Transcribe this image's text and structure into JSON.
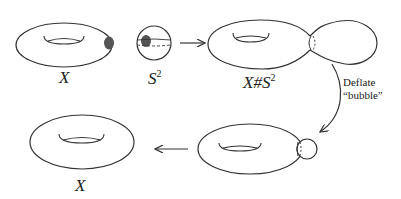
{
  "figure": {
    "stroke_color": "#333333",
    "blob_color": "#555555",
    "labels": {
      "torus_top": "X",
      "sphere_base": "S",
      "sphere_exp": "2",
      "sum_base": "X#S",
      "sum_exp": "2",
      "deflate_line1": "Deflate",
      "deflate_line2": "“bubble”",
      "torus_bottom": "X"
    },
    "nodes": [
      {
        "id": "torus-X",
        "label": "X"
      },
      {
        "id": "sphere-S2",
        "label": "S^2"
      },
      {
        "id": "connected-sum",
        "label": "X#S^2"
      },
      {
        "id": "torus-small-bubble",
        "label": ""
      },
      {
        "id": "torus-X-result",
        "label": "X"
      }
    ],
    "edges": [
      {
        "from": "sphere-S2",
        "to": "connected-sum",
        "label": ""
      },
      {
        "from": "connected-sum",
        "to": "torus-small-bubble",
        "label": "Deflate “bubble”"
      },
      {
        "from": "torus-small-bubble",
        "to": "torus-X-result",
        "label": ""
      }
    ]
  }
}
